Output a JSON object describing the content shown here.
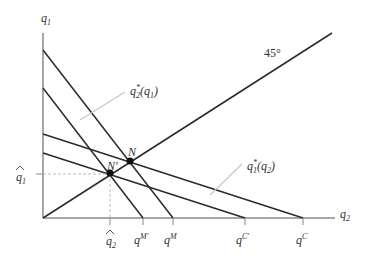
{
  "diagram": {
    "axes": {
      "y_label": "q",
      "y_label_sub": "1",
      "x_label": "q",
      "x_label_sub": "2"
    },
    "angle_label": "45°",
    "curves": {
      "firm2_reaction": {
        "label": "q",
        "sub": "2",
        "sup": "*",
        "arg": "(q",
        "arg_sub": "1",
        "close": ")"
      },
      "firm1_reaction": {
        "label": "q",
        "sub": "1",
        "sup": "*",
        "arg": "(q",
        "arg_sub": "2",
        "close": ")"
      }
    },
    "points": {
      "N": "N",
      "N_prime": "N'"
    },
    "ticks": {
      "q1_hat": {
        "base": "q",
        "sub": "1",
        "hat": "^"
      },
      "q2_hat": {
        "base": "q",
        "sub": "2",
        "hat": "^"
      },
      "qM_prime": {
        "base": "q",
        "sup": "M'"
      },
      "qM": {
        "base": "q",
        "sup": "M"
      },
      "qC_prime": {
        "base": "q",
        "sup": "C'"
      },
      "qC": {
        "base": "q",
        "sup": "C"
      }
    },
    "colors": {
      "line": "#2a2a2a",
      "axis": "#8a8a8a",
      "leader": "#c8c8c8",
      "dashed": "#bdbdbd",
      "text": "#333333"
    }
  }
}
